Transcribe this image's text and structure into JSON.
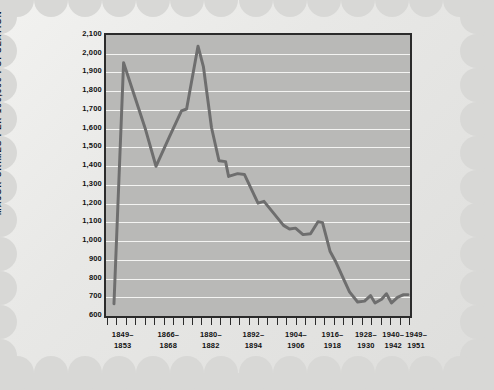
{
  "chart_data": {
    "type": "line",
    "title": "",
    "subtitle": "",
    "xlabel": "",
    "ylabel": "MAJOR CRIMES PER 100,000 POPULATION",
    "ylim": [
      600,
      2100
    ],
    "y_tick_step": 100,
    "y_ticks": [
      600,
      700,
      800,
      900,
      1000,
      1100,
      1200,
      1300,
      1400,
      1500,
      1600,
      1700,
      1800,
      1900,
      2000,
      2100
    ],
    "y_tick_labels": [
      "600",
      "700",
      "800",
      "900",
      "1,000",
      "1,100",
      "1,200",
      "1,300",
      "1,400",
      "1,500",
      "1,600",
      "1,700",
      "1,800",
      "1,900",
      "2,000",
      "2,100"
    ],
    "grid": true,
    "grid_axis": "y",
    "legend": false,
    "legend_position": "none",
    "x_tick_labels": [
      {
        "line1": "1849–",
        "line2": "1853",
        "x": 0.055
      },
      {
        "line1": "1866–",
        "line2": "1868",
        "x": 0.205
      },
      {
        "line1": "1880–",
        "line2": "1882",
        "x": 0.345
      },
      {
        "line1": "1892–",
        "line2": "1894",
        "x": 0.485
      },
      {
        "line1": "1904–",
        "line2": "1906",
        "x": 0.625
      },
      {
        "line1": "1916–",
        "line2": "1918",
        "x": 0.745
      },
      {
        "line1": "1928–",
        "line2": "1930",
        "x": 0.855
      },
      {
        "line1": "1940–",
        "line2": "1942",
        "x": 0.945
      },
      {
        "line1": "1949–",
        "line2": "1951",
        "x": 1.02
      }
    ],
    "x_minor_tick_count": 33,
    "series": [
      {
        "name": "Major crimes per 100,000 population",
        "color": "#6e6e6e",
        "points": [
          {
            "x": 0.02,
            "y": 655
          },
          {
            "x": 0.052,
            "y": 1960
          },
          {
            "x": 0.125,
            "y": 1600
          },
          {
            "x": 0.16,
            "y": 1400
          },
          {
            "x": 0.205,
            "y": 1560
          },
          {
            "x": 0.245,
            "y": 1700
          },
          {
            "x": 0.262,
            "y": 1710
          },
          {
            "x": 0.3,
            "y": 2050
          },
          {
            "x": 0.318,
            "y": 1940
          },
          {
            "x": 0.345,
            "y": 1610
          },
          {
            "x": 0.37,
            "y": 1430
          },
          {
            "x": 0.392,
            "y": 1425
          },
          {
            "x": 0.402,
            "y": 1345
          },
          {
            "x": 0.432,
            "y": 1360
          },
          {
            "x": 0.455,
            "y": 1355
          },
          {
            "x": 0.5,
            "y": 1200
          },
          {
            "x": 0.52,
            "y": 1210
          },
          {
            "x": 0.545,
            "y": 1160
          },
          {
            "x": 0.585,
            "y": 1080
          },
          {
            "x": 0.605,
            "y": 1060
          },
          {
            "x": 0.625,
            "y": 1065
          },
          {
            "x": 0.65,
            "y": 1030
          },
          {
            "x": 0.675,
            "y": 1035
          },
          {
            "x": 0.7,
            "y": 1100
          },
          {
            "x": 0.715,
            "y": 1095
          },
          {
            "x": 0.74,
            "y": 940
          },
          {
            "x": 0.76,
            "y": 880
          },
          {
            "x": 0.785,
            "y": 790
          },
          {
            "x": 0.805,
            "y": 720
          },
          {
            "x": 0.832,
            "y": 665
          },
          {
            "x": 0.855,
            "y": 670
          },
          {
            "x": 0.875,
            "y": 700
          },
          {
            "x": 0.89,
            "y": 660
          },
          {
            "x": 0.912,
            "y": 680
          },
          {
            "x": 0.928,
            "y": 710
          },
          {
            "x": 0.945,
            "y": 660
          },
          {
            "x": 0.965,
            "y": 690
          },
          {
            "x": 0.985,
            "y": 705
          },
          {
            "x": 1.0,
            "y": 705
          }
        ]
      }
    ],
    "colors": {
      "plot_background": "#b9b9b7",
      "gridline": "#f4f4f2",
      "frame": "#2b2b2b",
      "series_line": "#6e6e6e",
      "text": "#111111",
      "card_background": "#ececea",
      "page_background": "#d8d8d6"
    }
  }
}
